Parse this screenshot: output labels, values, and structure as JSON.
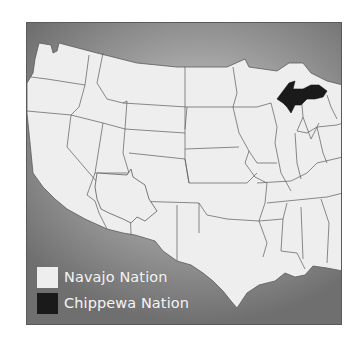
{
  "map": {
    "subject": "Contiguous United States",
    "colors": {
      "background_light": "#d8d8d8",
      "background_dark": "#6f6f6f",
      "land": "#eeeeee",
      "borders": "#5a5a5a",
      "navajo": "#eeeeee",
      "chippewa": "#1a1a1a"
    },
    "highlighted_regions": [
      {
        "name": "Navajo Nation",
        "location": "Four Corners (Arizona/New Mexico/Utah/Colorado)",
        "fill": "#eeeeee"
      },
      {
        "name": "Chippewa Nation",
        "location": "Upper Peninsula of Michigan",
        "fill": "#1a1a1a"
      }
    ]
  },
  "legend": {
    "items": [
      {
        "label": "Navajo Nation",
        "color": "#eeeeee"
      },
      {
        "label": "Chippewa Nation",
        "color": "#1a1a1a"
      }
    ]
  }
}
